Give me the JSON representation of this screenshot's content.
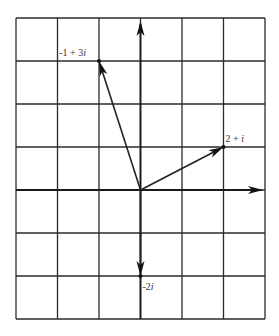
{
  "diagram": {
    "grid": {
      "columns": 6,
      "rows": 7,
      "left": 16,
      "top": 18,
      "cell_width": 41.5,
      "cell_height": 43,
      "line_color": "#2a2a2a"
    },
    "origin": {
      "col": 3,
      "row": 4
    },
    "axes": {
      "real_axis": "horizontal, arrow pointing right",
      "imaginary_axis": "vertical, arrows pointing up and down"
    },
    "vectors": [
      {
        "label_prefix": "-1 + 3",
        "label_suffix": "i",
        "re": -1,
        "im": 3
      },
      {
        "label_prefix": "2 + ",
        "label_suffix": "i",
        "re": 2,
        "im": 1
      },
      {
        "label_prefix": "-2",
        "label_suffix": "i",
        "re": 0,
        "im": -2
      }
    ],
    "colors": {
      "stroke": "#222222",
      "background": "#ffffff",
      "label": "#333333"
    }
  }
}
